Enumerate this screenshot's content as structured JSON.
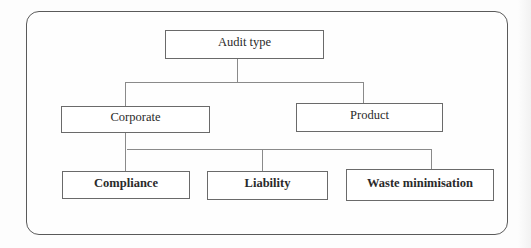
{
  "diagram": {
    "type": "hierarchy-tree",
    "root": {
      "id": "audit-type",
      "label": "Audit type"
    },
    "level1": [
      {
        "id": "corporate",
        "label": "Corporate"
      },
      {
        "id": "product",
        "label": "Product"
      }
    ],
    "level2": [
      {
        "id": "compliance",
        "label": "Compliance",
        "parent": "corporate"
      },
      {
        "id": "liability",
        "label": "Liability",
        "parent": "corporate"
      },
      {
        "id": "waste-minimisation",
        "label": "Waste minimisation",
        "parent": "corporate"
      }
    ],
    "edges": [
      [
        "audit-type",
        "corporate"
      ],
      [
        "audit-type",
        "product"
      ],
      [
        "corporate",
        "compliance"
      ],
      [
        "corporate",
        "liability"
      ],
      [
        "corporate",
        "waste-minimisation"
      ]
    ],
    "colors": {
      "border": "#5a5a5a",
      "connector": "#8a8a8a",
      "text": "#2a2a2a",
      "background": "#fdfdfd"
    }
  }
}
